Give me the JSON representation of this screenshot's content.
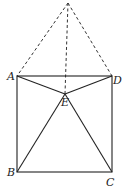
{
  "diagram": {
    "type": "geometry",
    "points": {
      "apex": {
        "x": 68,
        "y": 3,
        "label": ""
      },
      "A": {
        "x": 17,
        "y": 76,
        "label": "A"
      },
      "D": {
        "x": 112,
        "y": 76,
        "label": "D"
      },
      "E": {
        "x": 65,
        "y": 94,
        "label": "E"
      },
      "B": {
        "x": 17,
        "y": 172,
        "label": "B"
      },
      "C": {
        "x": 112,
        "y": 172,
        "label": "C"
      }
    },
    "labels": {
      "A": "A",
      "B": "B",
      "C": "C",
      "D": "D",
      "E": "E"
    },
    "colors": {
      "stroke": "#222222",
      "background": "#ffffff"
    }
  }
}
